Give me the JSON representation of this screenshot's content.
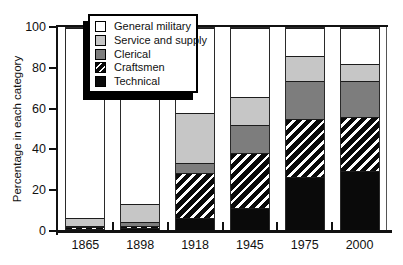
{
  "chart_data": {
    "type": "bar",
    "stacked": true,
    "title": "",
    "xlabel": "",
    "ylabel": "Percentage in each category",
    "categories": [
      "1865",
      "1898",
      "1918",
      "1945",
      "1975",
      "2000"
    ],
    "series": [
      {
        "name": "Technical",
        "style": "solid",
        "color": "#0a0a0a",
        "values": [
          0.5,
          1,
          6,
          11,
          26,
          29
        ]
      },
      {
        "name": "Craftsmen",
        "style": "hatch",
        "color": "#0a0a0a",
        "hatch_color": "#ffffff",
        "values": [
          1,
          1,
          22,
          27,
          29,
          27
        ]
      },
      {
        "name": "Clerical",
        "style": "solid",
        "color": "#7d7d7d",
        "values": [
          0.5,
          2,
          5,
          14,
          19,
          18
        ]
      },
      {
        "name": "Service and supply",
        "style": "solid",
        "color": "#c6c6c6",
        "values": [
          4,
          9,
          25,
          14,
          12,
          8
        ]
      },
      {
        "name": "General military",
        "style": "solid",
        "color": "#ffffff",
        "values": [
          94,
          87,
          42,
          34,
          14,
          18
        ]
      }
    ],
    "cumulative_tops_percent": {
      "1865": [
        0.5,
        1.5,
        2,
        6,
        100
      ],
      "1898": [
        1,
        2,
        4,
        13,
        100
      ],
      "1918": [
        6,
        28,
        33,
        58,
        100
      ],
      "1945": [
        11,
        38,
        52,
        66,
        100
      ],
      "1975": [
        26,
        55,
        74,
        86,
        100
      ],
      "2000": [
        29,
        56,
        74,
        82,
        100
      ]
    },
    "ylim": [
      0,
      100
    ],
    "yticks": [
      0,
      20,
      40,
      60,
      80,
      100
    ],
    "grid": false,
    "legend": {
      "position": "top-left",
      "order": [
        "General military",
        "Service and supply",
        "Clerical",
        "Craftsmen",
        "Technical"
      ]
    },
    "colors": {
      "bar_outline": "#2a2a2a",
      "axis": "#111111",
      "text": "#111111",
      "background": "#ffffff"
    }
  }
}
